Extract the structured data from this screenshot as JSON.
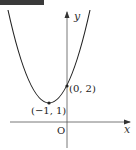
{
  "diagram": {
    "type": "parabola-graph",
    "axes": {
      "x_label": "x",
      "y_label": "y",
      "origin_label": "O"
    },
    "points": [
      {
        "label": "(−1, 1)",
        "x": -1,
        "y": 1,
        "role": "vertex"
      },
      {
        "label": "(0, 2)",
        "x": 0,
        "y": 2,
        "role": "y-intercept"
      }
    ],
    "curve": "y = (x + 1)^2 + 1",
    "colors": {
      "axis": "#555555",
      "curve": "#222222",
      "banner": "#3a3a3a"
    }
  }
}
